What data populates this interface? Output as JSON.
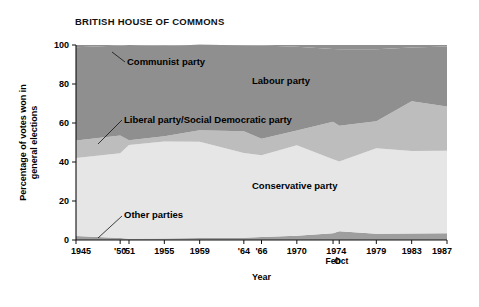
{
  "chart_title": "BRITISH HOUSE OF COMMONS",
  "axes": {
    "y_title_line1": "Percentage of votes won in",
    "y_title_line2": "general elections",
    "x_title": "Year",
    "y_ticks": [
      "0",
      "20",
      "40",
      "60",
      "80",
      "100"
    ],
    "x_tick_labels": [
      "1945",
      "'50",
      "'51",
      "1955",
      "1959",
      "'64",
      "'66",
      "1970",
      "1974",
      "1979",
      "1983",
      "1987"
    ],
    "x_sub_labels": [
      "Feb",
      "Oct"
    ]
  },
  "series_labels": {
    "communist": "Communist party",
    "labour": "Labour party",
    "liberal": "Liberal party/Social Democratic party",
    "conservative": "Conservative party",
    "other": "Other parties"
  },
  "colors": {
    "labour": "#8f8f8f",
    "liberal": "#bdbdbd",
    "conservative": "#e6e6e6",
    "other": "#9e9e9e",
    "axis": "#111111",
    "background": "#ffffff"
  },
  "chart_data": {
    "type": "area",
    "stacked": true,
    "title": "BRITISH HOUSE OF COMMONS",
    "xlabel": "Year",
    "ylabel": "Percentage of votes won in general elections",
    "ylim": [
      0,
      100
    ],
    "grid": false,
    "legend": "inline-annotations",
    "categories": [
      "1945",
      "'50",
      "'51",
      "1955",
      "1959",
      "'64",
      "'66",
      "1970",
      "1974 Feb",
      "1974 Oct",
      "1979",
      "1983",
      "1987"
    ],
    "x_positions": [
      1945,
      1950,
      1951,
      1955,
      1959,
      1964,
      1966,
      1970,
      1974.1,
      1974.8,
      1979,
      1983,
      1987
    ],
    "series": [
      {
        "name": "Other parties",
        "values": [
          2.0,
          1.0,
          0.7,
          0.8,
          1.0,
          1.2,
          1.5,
          2.2,
          3.5,
          4.5,
          3.2,
          3.3,
          3.5
        ]
      },
      {
        "name": "Conservative party",
        "values": [
          40.0,
          43.5,
          48.0,
          49.7,
          49.4,
          43.4,
          41.9,
          46.4,
          37.9,
          35.8,
          43.9,
          42.4,
          42.3
        ]
      },
      {
        "name": "Liberal party/Social Democratic party",
        "values": [
          9.0,
          9.1,
          2.5,
          2.7,
          5.9,
          11.2,
          8.5,
          7.5,
          19.3,
          18.3,
          13.8,
          25.4,
          22.6
        ]
      },
      {
        "name": "Labour party",
        "values": [
          47.8,
          46.1,
          48.8,
          46.4,
          43.8,
          44.1,
          47.9,
          43.0,
          37.2,
          39.2,
          36.9,
          27.6,
          30.8
        ]
      },
      {
        "name": "Communist party",
        "values": [
          1.2,
          0.3,
          0.0,
          0.4,
          0.0,
          0.1,
          0.2,
          0.9,
          2.1,
          2.2,
          2.2,
          1.3,
          0.8
        ]
      }
    ]
  }
}
